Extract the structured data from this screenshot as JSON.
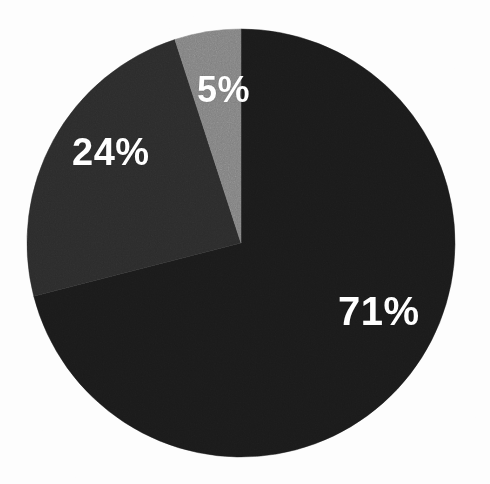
{
  "chart_data": {
    "type": "pie",
    "title": "",
    "subtitle": "",
    "xlabel": "",
    "ylabel": "",
    "grid": false,
    "legend_position": "none",
    "labels_inside_slices": true,
    "total": 100,
    "units": "percent",
    "categories": [
      "71%",
      "24%",
      "5%"
    ],
    "values": [
      71,
      24,
      5
    ],
    "slices": [
      {
        "label": "71%",
        "value": 71,
        "color": "#1a1a1a",
        "start_angle_deg": 0,
        "end_angle_deg": 255.6,
        "label_color": "#ffffff"
      },
      {
        "label": "24%",
        "value": 24,
        "color": "#2b2b2b",
        "start_angle_deg": 255.6,
        "end_angle_deg": 342.0,
        "label_color": "#ffffff"
      },
      {
        "label": "5%",
        "value": 5,
        "color": "#808080",
        "start_angle_deg": 342.0,
        "end_angle_deg": 360.0,
        "label_color": "#ffffff"
      }
    ],
    "geometry": {
      "center_x": 241,
      "center_y": 243,
      "radius": 214,
      "start_angle_deg": 0,
      "direction": "clockwise"
    },
    "background_color": "#fdfdfd"
  },
  "labels": {
    "slice_71": "71%",
    "slice_24": "24%",
    "slice_5": "5%"
  }
}
